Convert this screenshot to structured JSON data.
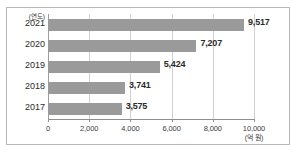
{
  "chart_data": {
    "type": "bar",
    "orientation": "horizontal",
    "title": "",
    "xlabel": "(억 원)",
    "ylabel": "(연도)",
    "categories": [
      "2021",
      "2020",
      "2019",
      "2018",
      "2017"
    ],
    "values": [
      9517,
      7207,
      5424,
      3741,
      3575
    ],
    "value_labels": [
      "9,517",
      "7,207",
      "5,424",
      "3,741",
      "3,575"
    ],
    "xlim": [
      0,
      10000
    ],
    "xticks": [
      0,
      2000,
      4000,
      6000,
      8000,
      10000
    ],
    "xtick_labels": [
      "0",
      "2,000",
      "4,000",
      "6,000",
      "8,000",
      "10,000"
    ],
    "grid": true,
    "grid_axis": "x",
    "legend": false,
    "series": [
      {
        "name": "",
        "values": [
          9517,
          7207,
          5424,
          3741,
          3575
        ],
        "color": "#9a9a9a"
      }
    ]
  },
  "colors": {
    "bar_fill": "#9a9a9a",
    "gridline": "#d0d0d0",
    "axis_line": "#8f8f8f",
    "frame_border": "#b8b8b8",
    "text": "#2b2b2b",
    "background": "#ffffff"
  }
}
